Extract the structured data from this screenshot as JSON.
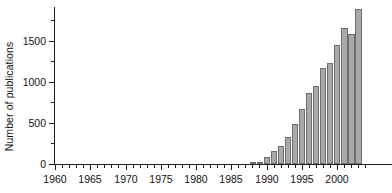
{
  "chart_data": {
    "type": "bar",
    "title": "",
    "subtitle": "",
    "xlabel": "",
    "ylabel": "Number of publications",
    "xlim": [
      1960,
      2004
    ],
    "ylim": [
      0,
      1910
    ],
    "grid": false,
    "legend": null,
    "bar_color": "#a9a9a9",
    "bar_border_color": "#6e6e6e",
    "axis_color": "#1c1c1c",
    "y_ticks_major": [
      0,
      500,
      1000,
      1500
    ],
    "y_ticks_major_labels": [
      "0",
      "500",
      "1000",
      "1500"
    ],
    "y_ticks_minor": [
      250,
      750,
      1250,
      1750
    ],
    "x_ticks_major": [
      1960,
      1965,
      1970,
      1975,
      1980,
      1985,
      1990,
      1995,
      2000
    ],
    "x_ticks_major_labels": [
      "1960",
      "1965",
      "1970",
      "1975",
      "1980",
      "1985",
      "1990",
      "1995",
      "2000"
    ],
    "categories": [
      1960,
      1961,
      1962,
      1963,
      1964,
      1965,
      1966,
      1967,
      1968,
      1969,
      1970,
      1971,
      1972,
      1973,
      1974,
      1975,
      1976,
      1977,
      1978,
      1979,
      1980,
      1981,
      1982,
      1983,
      1984,
      1985,
      1986,
      1987,
      1988,
      1989,
      1990,
      1991,
      1992,
      1993,
      1994,
      1995,
      1996,
      1997,
      1998,
      1999,
      2000,
      2001,
      2002,
      2003
    ],
    "values": [
      0,
      0,
      0,
      0,
      0,
      0,
      0,
      0,
      0,
      0,
      0,
      0,
      0,
      0,
      0,
      0,
      0,
      0,
      0,
      0,
      0,
      0,
      0,
      0,
      0,
      0,
      0,
      0,
      20,
      25,
      80,
      160,
      215,
      330,
      485,
      665,
      860,
      950,
      1170,
      1230,
      1450,
      1650,
      1585,
      1890
    ]
  }
}
